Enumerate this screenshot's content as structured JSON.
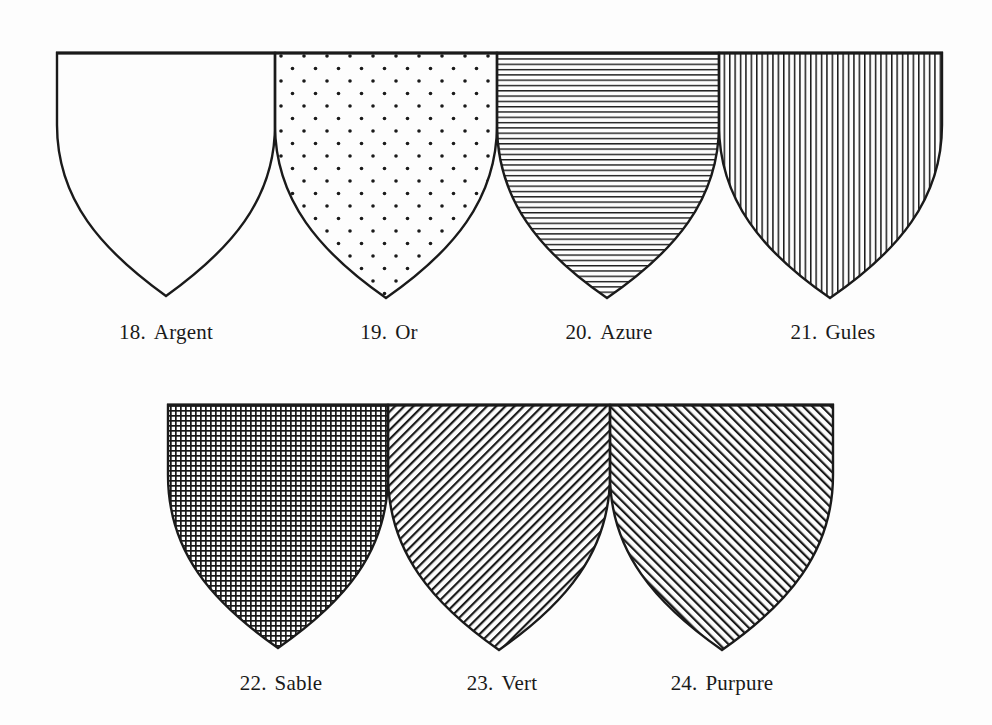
{
  "plate": {
    "subject": "Heraldic tinctures (hatching conventions)",
    "ink_color": "#1a1a1a",
    "paper_color": "#fdfdfd"
  },
  "rows": [
    {
      "shields": [
        {
          "number": "18.",
          "name": "Argent",
          "pattern": "plain",
          "meaning": "silver / white"
        },
        {
          "number": "19.",
          "name": "Or",
          "pattern": "dots",
          "meaning": "gold / yellow"
        },
        {
          "number": "20.",
          "name": "Azure",
          "pattern": "horizontal-lines",
          "meaning": "blue"
        },
        {
          "number": "21.",
          "name": "Gules",
          "pattern": "vertical-lines",
          "meaning": "red"
        }
      ]
    },
    {
      "shields": [
        {
          "number": "22.",
          "name": "Sable",
          "pattern": "crosshatch",
          "meaning": "black"
        },
        {
          "number": "23.",
          "name": "Vert",
          "pattern": "diagonal-bend",
          "meaning": "green"
        },
        {
          "number": "24.",
          "name": "Purpure",
          "pattern": "diagonal-bend-sinister",
          "meaning": "purple"
        }
      ]
    }
  ]
}
